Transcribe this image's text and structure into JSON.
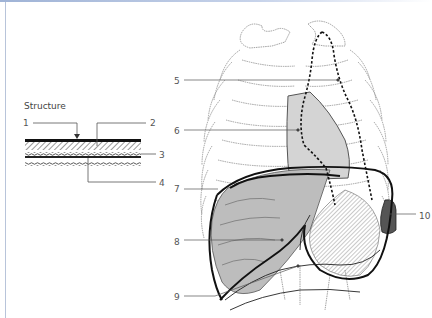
{
  "figure": {
    "structure_title": "Structure",
    "structure_labels": [
      {
        "id": "1",
        "text": "1"
      },
      {
        "id": "2",
        "text": "2"
      },
      {
        "id": "3",
        "text": "3"
      },
      {
        "id": "4",
        "text": "4"
      }
    ],
    "anatomy_labels": [
      {
        "id": "5",
        "text": "5"
      },
      {
        "id": "6",
        "text": "6"
      },
      {
        "id": "7",
        "text": "7"
      },
      {
        "id": "8",
        "text": "8"
      },
      {
        "id": "9",
        "text": "9"
      },
      {
        "id": "10",
        "text": "10"
      }
    ]
  },
  "colors": {
    "frame_top": "#9fb3d6",
    "frame_left": "#b8c4da",
    "heart_fill": "#d4d4d4",
    "liver_fill": "#bdbdbd",
    "spleen_fill": "#555555",
    "rib_outline": "#8a8a8a"
  }
}
